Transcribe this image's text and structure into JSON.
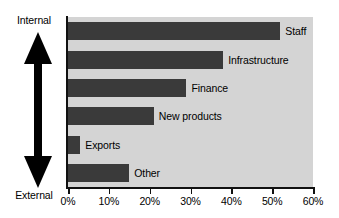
{
  "chart_data": {
    "type": "bar",
    "orientation": "horizontal",
    "title": "",
    "xlabel": "",
    "ylabel": "",
    "categories": [
      "Staff",
      "Infrastructure",
      "Finance",
      "New products",
      "Exports",
      "Other"
    ],
    "values": [
      52,
      38,
      29,
      21,
      3,
      15
    ],
    "xlim": [
      0,
      60
    ],
    "xticks": [
      0,
      10,
      20,
      30,
      40,
      50,
      60
    ],
    "xtick_labels": [
      "0%",
      "10%",
      "20%",
      "30%",
      "40%",
      "50%",
      "60%"
    ],
    "grid": false,
    "legend": null,
    "bar_color": "#3a3a3a",
    "plot_background": "#d4d4d4",
    "annotations": {
      "axis_direction": {
        "top_label": "Internal",
        "bottom_label": "External",
        "icon": "double-headed-vertical-arrow"
      }
    }
  },
  "axis_arrow": {
    "top_label": "Internal",
    "bottom_label": "External"
  }
}
